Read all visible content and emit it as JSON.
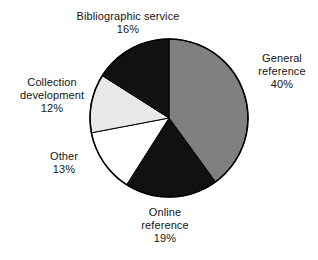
{
  "figure": {
    "background_color": "#ffffff",
    "text_color": "#141414",
    "outline_color": "#000000"
  },
  "chart_data": {
    "type": "pie",
    "title": "",
    "subtitle": "",
    "xlabel": "",
    "ylabel": "",
    "legend_position": "none",
    "labels_position": "outside-callout",
    "grid": false,
    "start_angle_deg": 0,
    "direction": "clockwise",
    "units": "percent",
    "total": 100,
    "categories": [
      "General reference",
      "Online reference",
      "Other",
      "Collection development",
      "Bibliographic service"
    ],
    "values": [
      40,
      19,
      13,
      12,
      16
    ],
    "slices": [
      {
        "name": "General reference",
        "label_line1": "General",
        "label_line2": "reference",
        "value": 40,
        "value_label": "40%",
        "color": "#808080",
        "stroke": "#000000",
        "start_deg": 0,
        "end_deg": 144
      },
      {
        "name": "Online reference",
        "label_line1": "Online",
        "label_line2": "reference",
        "value": 19,
        "value_label": "19%",
        "color": "#111111",
        "stroke": "#000000",
        "start_deg": 144,
        "end_deg": 212.4
      },
      {
        "name": "Other",
        "label_line1": "Other",
        "label_line2": "",
        "value": 13,
        "value_label": "13%",
        "color": "#ffffff",
        "stroke": "#000000",
        "start_deg": 212.4,
        "end_deg": 259.2
      },
      {
        "name": "Collection development",
        "label_line1": "Collection",
        "label_line2": "development",
        "value": 12,
        "value_label": "12%",
        "color": "#e8e8e8",
        "stroke": "#000000",
        "start_deg": 259.2,
        "end_deg": 302.4
      },
      {
        "name": "Bibliographic service",
        "label_line1": "Bibliographic service",
        "label_line2": "",
        "value": 16,
        "value_label": "16%",
        "color": "#111111",
        "stroke": "#000000",
        "start_deg": 302.4,
        "end_deg": 360
      }
    ]
  }
}
